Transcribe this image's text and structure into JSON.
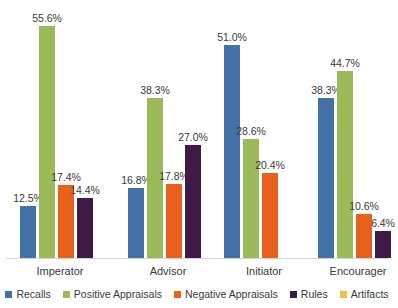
{
  "chart_data": {
    "type": "bar",
    "title": "",
    "subtitle": "",
    "xlabel": "",
    "ylabel": "",
    "ylim": [
      0,
      60
    ],
    "grid": false,
    "legend_position": "bottom",
    "value_label_suffix": "%",
    "categories": [
      "Imperator",
      "Advisor",
      "Initiator",
      "Encourager"
    ],
    "series": [
      {
        "name": "Recalls",
        "color": "#4472A8",
        "values": [
          12.5,
          16.8,
          51.0,
          38.3
        ],
        "labels": [
          "12.5%",
          "16.8%",
          "51.0%",
          "38.3%"
        ]
      },
      {
        "name": "Positive Appraisals",
        "color": "#9BBB59",
        "values": [
          55.6,
          38.3,
          28.6,
          44.7
        ],
        "labels": [
          "55.6%",
          "38.3%",
          "28.6%",
          "44.7%"
        ]
      },
      {
        "name": "Negative Appraisals",
        "color": "#E8611C",
        "values": [
          17.4,
          17.8,
          20.4,
          10.6
        ],
        "labels": [
          "17.4%",
          "17.8%",
          "20.4%",
          "10.6%"
        ]
      },
      {
        "name": "Rules",
        "color": "#3F1A47",
        "values": [
          14.4,
          27.0,
          null,
          6.4
        ],
        "labels": [
          "14.4%",
          "27.0%",
          "",
          "6.4%"
        ]
      },
      {
        "name": "Artifacts",
        "color": "#F0C04A",
        "values": [
          null,
          null,
          null,
          null
        ],
        "labels": [
          "",
          "",
          "",
          ""
        ]
      }
    ]
  },
  "legend": {
    "items": [
      {
        "label": "Recalls",
        "color": "#4472A8"
      },
      {
        "label": "Positive Appraisals",
        "color": "#9BBB59"
      },
      {
        "label": "Negative Appraisals",
        "color": "#E8611C"
      },
      {
        "label": "Rules",
        "color": "#3F1A47"
      },
      {
        "label": "Artifacts",
        "color": "#F0C04A"
      }
    ]
  },
  "axis": {
    "baseline_color": "#d4d4d4"
  }
}
